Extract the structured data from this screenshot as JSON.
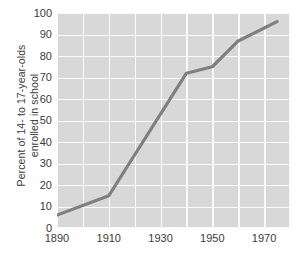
{
  "chart_data": {
    "type": "line",
    "title": "",
    "xlabel": "",
    "ylabel": "Percent of 14- to 17-year-olds enrolled in school",
    "ylabel_line1": "Percent of 14- to 17-year-olds",
    "ylabel_line2": "enrolled in school",
    "xlim": [
      1890,
      1980
    ],
    "ylim": [
      0,
      100
    ],
    "ytick_step": 10,
    "xtick_step": 20,
    "x_gridline_step": 10,
    "grid": true,
    "legend": "none",
    "yticks": [
      "100",
      "90",
      "80",
      "70",
      "60",
      "50",
      "40",
      "30",
      "20",
      "10",
      "0"
    ],
    "ytick_values": [
      100,
      90,
      80,
      70,
      60,
      50,
      40,
      30,
      20,
      10,
      0
    ],
    "xticks": [
      "1890",
      "1910",
      "1930",
      "1950",
      "1970"
    ],
    "xtick_values": [
      1890,
      1910,
      1930,
      1950,
      1970
    ],
    "x": [
      1890,
      1910,
      1940,
      1950,
      1960,
      1975
    ],
    "values": [
      6,
      15,
      72,
      75,
      87,
      96
    ],
    "series": [
      {
        "name": "Percent of 14- to 17-year-olds enrolled in school",
        "x": [
          1890,
          1910,
          1940,
          1950,
          1960,
          1975
        ],
        "values": [
          6,
          15,
          72,
          75,
          87,
          96
        ]
      }
    ],
    "points": [
      {
        "x": 1890,
        "y": 6
      },
      {
        "x": 1910,
        "y": 15
      },
      {
        "x": 1940,
        "y": 72
      },
      {
        "x": 1950,
        "y": 75
      },
      {
        "x": 1960,
        "y": 87
      },
      {
        "x": 1975,
        "y": 96
      }
    ],
    "colors": {
      "plot_background": "#d8d8d8",
      "gridline": "#fafafa",
      "line": "#807f7f",
      "text": "#3b3b3b",
      "page_background": "#ffffff"
    },
    "line_width": 3.2
  }
}
